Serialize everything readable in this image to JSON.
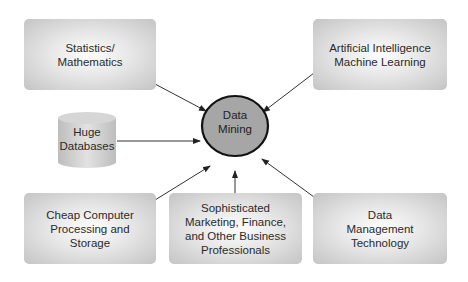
{
  "diagram": {
    "center": {
      "line1": "Data",
      "line2": "Mining",
      "fill": "#a6a6a6",
      "stroke": "#111111"
    },
    "nodes": [
      {
        "id": "statistics",
        "lines": [
          "Statistics/",
          "Mathematics"
        ],
        "position": "top-left"
      },
      {
        "id": "ai",
        "lines": [
          "Artificial Intelligence",
          "Machine Learning"
        ],
        "position": "top-right"
      },
      {
        "id": "databases",
        "lines": [
          "Huge",
          "Databases"
        ],
        "shape": "cylinder",
        "position": "middle-left"
      },
      {
        "id": "cheap-computing",
        "lines": [
          "Cheap Computer",
          "Processing and",
          "Storage"
        ],
        "position": "bottom-left"
      },
      {
        "id": "professionals",
        "lines": [
          "Sophisticated",
          "Marketing, Finance,",
          "and Other Business",
          "Professionals"
        ],
        "position": "bottom-center"
      },
      {
        "id": "data-management",
        "lines": [
          "Data",
          "Management",
          "Technology"
        ],
        "position": "bottom-right"
      }
    ],
    "edges": [
      {
        "from": "statistics",
        "to": "center"
      },
      {
        "from": "ai",
        "to": "center"
      },
      {
        "from": "databases",
        "to": "center"
      },
      {
        "from": "cheap-computing",
        "to": "center"
      },
      {
        "from": "professionals",
        "to": "center"
      },
      {
        "from": "data-management",
        "to": "center"
      }
    ],
    "colors": {
      "box_center": "#fdfdfd",
      "box_edge": "#c4c4c4",
      "arrow": "#333333"
    }
  }
}
